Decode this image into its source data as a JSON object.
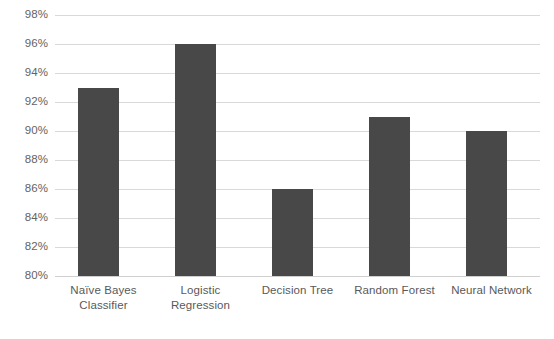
{
  "chart_data": {
    "type": "bar",
    "title": "",
    "subtitle": "",
    "xlabel": "",
    "ylabel": "",
    "categories": [
      "Naïve Bayes Classifier",
      "Logistic Regression",
      "Decision Tree",
      "Random Forest",
      "Neural Network"
    ],
    "category_lines": [
      [
        "Naïve Bayes",
        "Classifier"
      ],
      [
        "Logistic",
        "Regression"
      ],
      [
        "Decision Tree"
      ],
      [
        "Random Forest"
      ],
      [
        "Neural Network"
      ]
    ],
    "values": [
      93,
      96,
      86,
      91,
      90
    ],
    "value_labels": [
      "93%",
      "96%",
      "86%",
      "91%",
      "90%"
    ],
    "ylim": [
      80,
      98
    ],
    "ytick_values": [
      98,
      96,
      94,
      92,
      90,
      88,
      86,
      84,
      82,
      80
    ],
    "ytick_labels": [
      "98%",
      "96%",
      "94%",
      "92%",
      "90%",
      "88%",
      "86%",
      "84%",
      "82%",
      "80%"
    ],
    "grid": true,
    "legend": false,
    "legend_position": "none",
    "colors": {
      "bar_fill": "#484848",
      "gridline": "#d9d9d9",
      "axis_line": "#d0d0d0",
      "tick_text": "#636363",
      "category_text": "#595959",
      "background": "#ffffff"
    }
  }
}
